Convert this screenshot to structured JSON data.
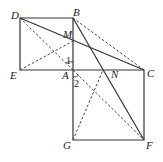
{
  "diagram": {
    "type": "geometry",
    "points": {
      "D": {
        "label": "D",
        "x": 20,
        "y": 18
      },
      "B": {
        "label": "B",
        "x": 73,
        "y": 18
      },
      "E": {
        "label": "E",
        "x": 20,
        "y": 70
      },
      "A": {
        "label": "A",
        "x": 73,
        "y": 70
      },
      "C": {
        "label": "C",
        "x": 144,
        "y": 70
      },
      "G": {
        "label": "G",
        "x": 73,
        "y": 140
      },
      "F": {
        "label": "F",
        "x": 144,
        "y": 140
      },
      "M": {
        "label": "M",
        "x": 73,
        "y": 41
      },
      "N": {
        "label": "N",
        "x": 103,
        "y": 70
      }
    },
    "angles": {
      "angle1": {
        "label": "1"
      },
      "angle2": {
        "label": "2"
      }
    },
    "squares": [
      "ABDE",
      "ACFG"
    ],
    "solid_segments": [
      "D-B",
      "B-A",
      "A-E",
      "E-D",
      "A-C",
      "C-F",
      "F-G",
      "G-A",
      "D-C",
      "B-F"
    ],
    "dashed_segments": [
      "D-A",
      "E-M",
      "B-C",
      "A-F",
      "G-N"
    ]
  }
}
